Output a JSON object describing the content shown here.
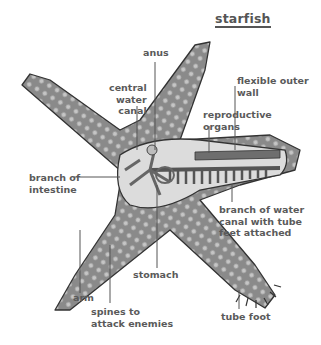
{
  "title": "starfish",
  "labels": {
    "anus": "anus",
    "central_water_canal": [
      "central",
      "water",
      "canal"
    ],
    "flexible_outer_wall": [
      "flexible outer",
      "wall"
    ],
    "reproductive_organs": [
      "reproductive",
      "organs"
    ],
    "branch_of_intestine": [
      "branch of",
      "intestine"
    ],
    "branch_of_water_canal": [
      "branch of water",
      "canal with tube",
      "feet attached"
    ],
    "stomach": "stomach",
    "arm": "arm",
    "spines": [
      "spines to",
      "attack enemies"
    ],
    "tube_foot": "tube foot"
  },
  "colors": {
    "body": "#8a8a8a",
    "body_dark": "#5e5e5e",
    "spots": "#c8c8c8",
    "interior": "#d9d9d9",
    "organs": "#6e6e6e",
    "label_text": "#5a5a5a",
    "leader_line": "#555555"
  }
}
